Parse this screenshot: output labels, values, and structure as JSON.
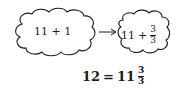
{
  "diagram": {
    "left_cloud": {
      "expression": "11 + 1"
    },
    "arrow": {
      "direction": "right"
    },
    "right_cloud": {
      "whole": "11",
      "operator": "+",
      "fraction": {
        "numerator": "3",
        "denominator": "3"
      }
    },
    "equation": {
      "lhs": "12",
      "equals": "=",
      "whole": "11",
      "fraction": {
        "numerator": "3",
        "denominator": "3"
      }
    },
    "colors": {
      "stroke": "#1a1a1a",
      "background": "#ffffff"
    }
  }
}
